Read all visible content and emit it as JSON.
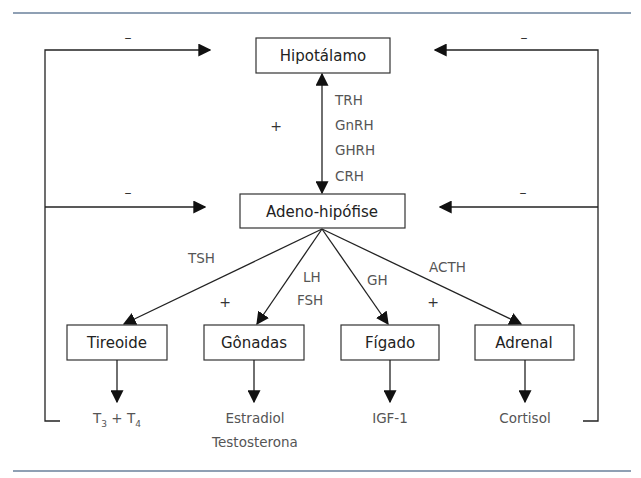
{
  "diagram": {
    "colors": {
      "rule": "#8fa0b4",
      "line": "#222222",
      "label_text": "#555555",
      "box_text": "#222222"
    },
    "nodes": {
      "hypothalamus": "Hipotálamo",
      "adenohypophysis": "Adeno-hipófise",
      "thyroid": "Tireoide",
      "gonads": "Gônadas",
      "liver": "Fígado",
      "adrenal": "Adrenal"
    },
    "releasing_hormones": [
      "TRH",
      "GnRH",
      "GHRH",
      "CRH"
    ],
    "pituitary_hormones": {
      "thyroid": "TSH",
      "gonads_1": "LH",
      "gonads_2": "FSH",
      "liver": "GH",
      "adrenal": "ACTH"
    },
    "products": {
      "thyroid_t3": "T",
      "thyroid_t3_sub": "3",
      "thyroid_plus": " + T",
      "thyroid_t4_sub": "4",
      "gonads_1": "Estradiol",
      "gonads_2": "Testosterona",
      "liver": "IGF-1",
      "adrenal": "Cortisol"
    },
    "signs": {
      "top_left_feedback": "–",
      "top_right_feedback": "–",
      "mid_left_feedback": "–",
      "mid_right_feedback": "–",
      "hypothalamus_stimulation": "+",
      "left_stimulation": "+",
      "right_stimulation": "+"
    }
  }
}
